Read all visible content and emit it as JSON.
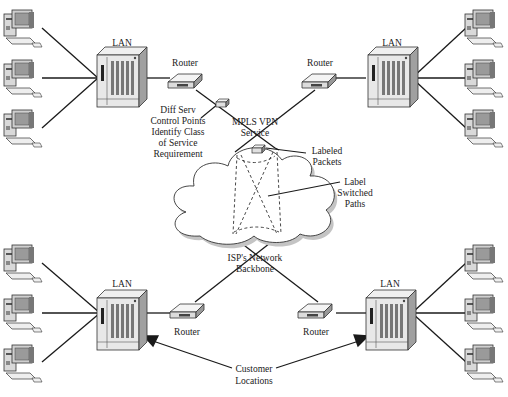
{
  "labels": {
    "lan_tl": "LAN",
    "lan_tr": "LAN",
    "lan_bl": "LAN",
    "lan_br": "LAN",
    "router_tl": "Router",
    "router_tr": "Router",
    "router_bl": "Router",
    "router_br": "Router",
    "diffserv": [
      "Diff Serv",
      "Control Points",
      "Identify Class",
      "of Service",
      "Requirement"
    ],
    "mpls": [
      "MPLS VPN",
      "Service"
    ],
    "labeled_packets": [
      "Labeled",
      "Packets"
    ],
    "label_switched": [
      "Label",
      "Switched",
      "Paths"
    ],
    "isp": [
      "ISP's Network",
      "Backbone"
    ],
    "customer": [
      "Customer",
      "Locations"
    ]
  },
  "nodes": {
    "sites": [
      "top-left",
      "top-right",
      "bottom-left",
      "bottom-right"
    ],
    "computers_per_site": 3
  },
  "colors": {
    "line": "#1a1a1a",
    "device_fill": "#e6e6e6",
    "device_dark": "#8a8a8a",
    "cloud_shadow": "#bdbdbd"
  }
}
